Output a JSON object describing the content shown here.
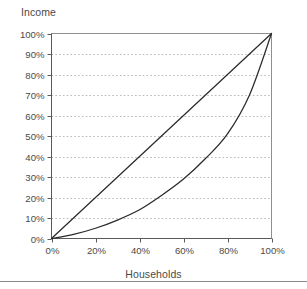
{
  "chart_data": {
    "type": "line",
    "title": "",
    "xlabel": "Households",
    "ylabel": "Income",
    "xlim": [
      0,
      100
    ],
    "ylim": [
      0,
      100
    ],
    "grid": true,
    "legend": "none",
    "xticks": [
      "0%",
      "20%",
      "40%",
      "60%",
      "80%",
      "100%"
    ],
    "xtick_values": [
      0,
      20,
      40,
      60,
      80,
      100
    ],
    "yticks": [
      "0%",
      "10%",
      "20%",
      "30%",
      "40%",
      "50%",
      "60%",
      "70%",
      "80%",
      "90%",
      "100%"
    ],
    "ytick_values": [
      0,
      10,
      20,
      30,
      40,
      50,
      60,
      70,
      80,
      90,
      100
    ],
    "x": [
      0,
      10,
      20,
      30,
      40,
      50,
      60,
      70,
      80,
      90,
      100
    ],
    "series": [
      {
        "name": "Line of equality",
        "style": "solid",
        "color": "#2b2b2b",
        "values": [
          0,
          10,
          20,
          30,
          40,
          50,
          60,
          70,
          80,
          90,
          100
        ]
      },
      {
        "name": "Lorenz curve",
        "style": "solid",
        "color": "#2b2b2b",
        "values": [
          0,
          2,
          5,
          9,
          14,
          21,
          29,
          39,
          51,
          70,
          100
        ]
      }
    ],
    "annotations": []
  },
  "colors": {
    "background": "#ffffff",
    "axis": "#5a5a5a",
    "gridline": "#b9b9b9",
    "curve": "#2b2b2b",
    "text": "#4a4a4a",
    "bottom_rule": "#8a8a8a"
  }
}
